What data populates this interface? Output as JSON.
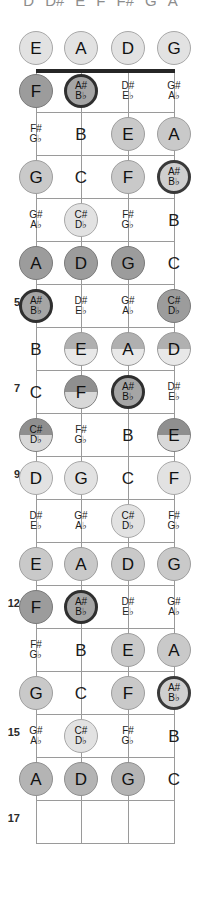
{
  "header": {
    "letters": [
      "D",
      "D#",
      "E",
      "F",
      "F#",
      "G",
      "A"
    ]
  },
  "diagram": {
    "instrument": "4-string bass",
    "string_labels": [
      "E",
      "A",
      "D",
      "G"
    ],
    "fret_marker_numbers": [
      "5",
      "7",
      "9",
      "12",
      "15",
      "17"
    ],
    "colors": {
      "nut": "#262626",
      "line": "#9a9a9a",
      "background": "#ffffff",
      "text": "#111111"
    }
  },
  "fret_numbers": [
    {
      "label": "5",
      "y": 296
    },
    {
      "label": "7",
      "y": 382
    },
    {
      "label": "9",
      "y": 468
    },
    {
      "label": "12",
      "y": 597
    },
    {
      "label": "15",
      "y": 726
    },
    {
      "label": "17",
      "y": 812
    }
  ],
  "strings_x": [
    36,
    81,
    128,
    174
  ],
  "nut_y": 69,
  "fret_lines_y": [
    112,
    155,
    198,
    241,
    284,
    327,
    370,
    413,
    456,
    499,
    542,
    585,
    628,
    671,
    714,
    757,
    800,
    843
  ],
  "notes": [
    {
      "s": 0,
      "f": 0,
      "y": 48,
      "top": "E",
      "bot": "",
      "style": "c-light",
      "kind": "natural"
    },
    {
      "s": 1,
      "f": 0,
      "y": 48,
      "top": "A",
      "bot": "",
      "style": "c-light",
      "kind": "natural"
    },
    {
      "s": 2,
      "f": 0,
      "y": 48,
      "top": "D",
      "bot": "",
      "style": "c-light",
      "kind": "natural"
    },
    {
      "s": 3,
      "f": 0,
      "y": 48,
      "top": "G",
      "bot": "",
      "style": "c-light",
      "kind": "natural"
    },
    {
      "s": 0,
      "f": 1,
      "y": 91,
      "top": "F",
      "bot": "",
      "style": "c-dark",
      "kind": "natural"
    },
    {
      "s": 1,
      "f": 1,
      "y": 91,
      "top": "A#",
      "bot": "B♭",
      "style": "c-ring",
      "kind": "accidental"
    },
    {
      "s": 2,
      "f": 1,
      "y": 91,
      "top": "D#",
      "bot": "E♭",
      "style": "c-none",
      "kind": "accidental"
    },
    {
      "s": 3,
      "f": 1,
      "y": 91,
      "top": "G#",
      "bot": "A♭",
      "style": "c-none",
      "kind": "accidental"
    },
    {
      "s": 0,
      "f": 2,
      "y": 134,
      "top": "F#",
      "bot": "G♭",
      "style": "c-none",
      "kind": "accidental"
    },
    {
      "s": 1,
      "f": 2,
      "y": 134,
      "top": "B",
      "bot": "",
      "style": "c-none",
      "kind": "natural"
    },
    {
      "s": 2,
      "f": 2,
      "y": 134,
      "top": "E",
      "bot": "",
      "style": "c-mid",
      "kind": "natural"
    },
    {
      "s": 3,
      "f": 2,
      "y": 134,
      "top": "A",
      "bot": "",
      "style": "c-mid",
      "kind": "natural"
    },
    {
      "s": 0,
      "f": 3,
      "y": 177,
      "top": "G",
      "bot": "",
      "style": "c-mid",
      "kind": "natural"
    },
    {
      "s": 1,
      "f": 3,
      "y": 177,
      "top": "C",
      "bot": "",
      "style": "c-none",
      "kind": "natural"
    },
    {
      "s": 2,
      "f": 3,
      "y": 177,
      "top": "F",
      "bot": "",
      "style": "c-mid",
      "kind": "natural"
    },
    {
      "s": 3,
      "f": 3,
      "y": 177,
      "top": "A#",
      "bot": "B♭",
      "style": "c-ringlt",
      "kind": "accidental"
    },
    {
      "s": 0,
      "f": 4,
      "y": 220,
      "top": "G#",
      "bot": "A♭",
      "style": "c-none",
      "kind": "accidental"
    },
    {
      "s": 1,
      "f": 4,
      "y": 220,
      "top": "C#",
      "bot": "D♭",
      "style": "c-light",
      "kind": "accidental"
    },
    {
      "s": 2,
      "f": 4,
      "y": 220,
      "top": "F#",
      "bot": "G♭",
      "style": "c-none",
      "kind": "accidental"
    },
    {
      "s": 3,
      "f": 4,
      "y": 220,
      "top": "B",
      "bot": "",
      "style": "c-none",
      "kind": "natural"
    },
    {
      "s": 0,
      "f": 5,
      "y": 263,
      "top": "A",
      "bot": "",
      "style": "c-dark",
      "kind": "natural"
    },
    {
      "s": 1,
      "f": 5,
      "y": 263,
      "top": "D",
      "bot": "",
      "style": "c-dark",
      "kind": "natural"
    },
    {
      "s": 2,
      "f": 5,
      "y": 263,
      "top": "G",
      "bot": "",
      "style": "c-dark",
      "kind": "natural"
    },
    {
      "s": 3,
      "f": 5,
      "y": 263,
      "top": "C",
      "bot": "",
      "style": "c-none",
      "kind": "natural"
    },
    {
      "s": 0,
      "f": 6,
      "y": 306,
      "top": "A#",
      "bot": "B♭",
      "style": "c-ring",
      "kind": "accidental"
    },
    {
      "s": 1,
      "f": 6,
      "y": 306,
      "top": "D#",
      "bot": "E♭",
      "style": "c-none",
      "kind": "accidental"
    },
    {
      "s": 2,
      "f": 6,
      "y": 306,
      "top": "G#",
      "bot": "A♭",
      "style": "c-none",
      "kind": "accidental"
    },
    {
      "s": 3,
      "f": 6,
      "y": 306,
      "top": "C#",
      "bot": "D♭",
      "style": "c-dark",
      "kind": "accidental"
    },
    {
      "s": 0,
      "f": 7,
      "y": 349,
      "top": "B",
      "bot": "",
      "style": "c-none",
      "kind": "natural"
    },
    {
      "s": 1,
      "f": 7,
      "y": 349,
      "top": "E",
      "bot": "",
      "style": "c-split",
      "kind": "natural"
    },
    {
      "s": 2,
      "f": 7,
      "y": 349,
      "top": "A",
      "bot": "",
      "style": "c-split",
      "kind": "natural"
    },
    {
      "s": 3,
      "f": 7,
      "y": 349,
      "top": "D",
      "bot": "",
      "style": "c-split",
      "kind": "natural"
    },
    {
      "s": 0,
      "f": 8,
      "y": 392,
      "top": "C",
      "bot": "",
      "style": "c-none",
      "kind": "natural"
    },
    {
      "s": 1,
      "f": 8,
      "y": 392,
      "top": "F",
      "bot": "",
      "style": "c-splitd",
      "kind": "natural"
    },
    {
      "s": 2,
      "f": 8,
      "y": 392,
      "top": "A#",
      "bot": "B♭",
      "style": "c-ring",
      "kind": "accidental"
    },
    {
      "s": 3,
      "f": 8,
      "y": 392,
      "top": "D#",
      "bot": "E♭",
      "style": "c-none",
      "kind": "accidental"
    },
    {
      "s": 0,
      "f": 9,
      "y": 435,
      "top": "C#",
      "bot": "D♭",
      "style": "c-splitd",
      "kind": "accidental"
    },
    {
      "s": 1,
      "f": 9,
      "y": 435,
      "top": "F#",
      "bot": "G♭",
      "style": "c-none",
      "kind": "accidental"
    },
    {
      "s": 2,
      "f": 9,
      "y": 435,
      "top": "B",
      "bot": "",
      "style": "c-none",
      "kind": "natural"
    },
    {
      "s": 3,
      "f": 9,
      "y": 435,
      "top": "E",
      "bot": "",
      "style": "c-splitd",
      "kind": "natural"
    },
    {
      "s": 0,
      "f": 10,
      "y": 478,
      "top": "D",
      "bot": "",
      "style": "c-light",
      "kind": "natural"
    },
    {
      "s": 1,
      "f": 10,
      "y": 478,
      "top": "G",
      "bot": "",
      "style": "c-light",
      "kind": "natural"
    },
    {
      "s": 2,
      "f": 10,
      "y": 478,
      "top": "C",
      "bot": "",
      "style": "c-none",
      "kind": "natural"
    },
    {
      "s": 3,
      "f": 10,
      "y": 478,
      "top": "F",
      "bot": "",
      "style": "c-light",
      "kind": "natural"
    },
    {
      "s": 0,
      "f": 11,
      "y": 521,
      "top": "D#",
      "bot": "E♭",
      "style": "c-none",
      "kind": "accidental"
    },
    {
      "s": 1,
      "f": 11,
      "y": 521,
      "top": "G#",
      "bot": "A♭",
      "style": "c-none",
      "kind": "accidental"
    },
    {
      "s": 2,
      "f": 11,
      "y": 521,
      "top": "C#",
      "bot": "D♭",
      "style": "c-light",
      "kind": "accidental"
    },
    {
      "s": 3,
      "f": 11,
      "y": 521,
      "top": "F#",
      "bot": "G♭",
      "style": "c-none",
      "kind": "accidental"
    },
    {
      "s": 0,
      "f": 12,
      "y": 564,
      "top": "E",
      "bot": "",
      "style": "c-mid",
      "kind": "natural"
    },
    {
      "s": 1,
      "f": 12,
      "y": 564,
      "top": "A",
      "bot": "",
      "style": "c-mid",
      "kind": "natural"
    },
    {
      "s": 2,
      "f": 12,
      "y": 564,
      "top": "D",
      "bot": "",
      "style": "c-mid",
      "kind": "natural"
    },
    {
      "s": 3,
      "f": 12,
      "y": 564,
      "top": "G",
      "bot": "",
      "style": "c-mid",
      "kind": "natural"
    },
    {
      "s": 0,
      "f": 13,
      "y": 607,
      "top": "F",
      "bot": "",
      "style": "c-dark",
      "kind": "natural"
    },
    {
      "s": 1,
      "f": 13,
      "y": 607,
      "top": "A#",
      "bot": "B♭",
      "style": "c-ring",
      "kind": "accidental"
    },
    {
      "s": 2,
      "f": 13,
      "y": 607,
      "top": "D#",
      "bot": "E♭",
      "style": "c-none",
      "kind": "accidental"
    },
    {
      "s": 3,
      "f": 13,
      "y": 607,
      "top": "G#",
      "bot": "A♭",
      "style": "c-none",
      "kind": "accidental"
    },
    {
      "s": 0,
      "f": 14,
      "y": 650,
      "top": "F#",
      "bot": "G♭",
      "style": "c-none",
      "kind": "accidental"
    },
    {
      "s": 1,
      "f": 14,
      "y": 650,
      "top": "B",
      "bot": "",
      "style": "c-none",
      "kind": "natural"
    },
    {
      "s": 2,
      "f": 14,
      "y": 650,
      "top": "E",
      "bot": "",
      "style": "c-mid",
      "kind": "natural"
    },
    {
      "s": 3,
      "f": 14,
      "y": 650,
      "top": "A",
      "bot": "",
      "style": "c-mid",
      "kind": "natural"
    },
    {
      "s": 0,
      "f": 15,
      "y": 693,
      "top": "G",
      "bot": "",
      "style": "c-mid",
      "kind": "natural"
    },
    {
      "s": 1,
      "f": 15,
      "y": 693,
      "top": "C",
      "bot": "",
      "style": "c-none",
      "kind": "natural"
    },
    {
      "s": 2,
      "f": 15,
      "y": 693,
      "top": "F",
      "bot": "",
      "style": "c-mid",
      "kind": "natural"
    },
    {
      "s": 3,
      "f": 15,
      "y": 693,
      "top": "A#",
      "bot": "B♭",
      "style": "c-ringlt",
      "kind": "accidental"
    },
    {
      "s": 0,
      "f": 16,
      "y": 736,
      "top": "G#",
      "bot": "A♭",
      "style": "c-none",
      "kind": "accidental"
    },
    {
      "s": 1,
      "f": 16,
      "y": 736,
      "top": "C#",
      "bot": "D♭",
      "style": "c-light",
      "kind": "accidental"
    },
    {
      "s": 2,
      "f": 16,
      "y": 736,
      "top": "F#",
      "bot": "G♭",
      "style": "c-none",
      "kind": "accidental"
    },
    {
      "s": 3,
      "f": 16,
      "y": 736,
      "top": "B",
      "bot": "",
      "style": "c-none",
      "kind": "natural"
    },
    {
      "s": 0,
      "f": 17,
      "y": 779,
      "top": "A",
      "bot": "",
      "style": "c-midd",
      "kind": "natural"
    },
    {
      "s": 1,
      "f": 17,
      "y": 779,
      "top": "D",
      "bot": "",
      "style": "c-midd",
      "kind": "natural"
    },
    {
      "s": 2,
      "f": 17,
      "y": 779,
      "top": "G",
      "bot": "",
      "style": "c-midd",
      "kind": "natural"
    },
    {
      "s": 3,
      "f": 17,
      "y": 779,
      "top": "C",
      "bot": "",
      "style": "c-none",
      "kind": "natural"
    }
  ]
}
